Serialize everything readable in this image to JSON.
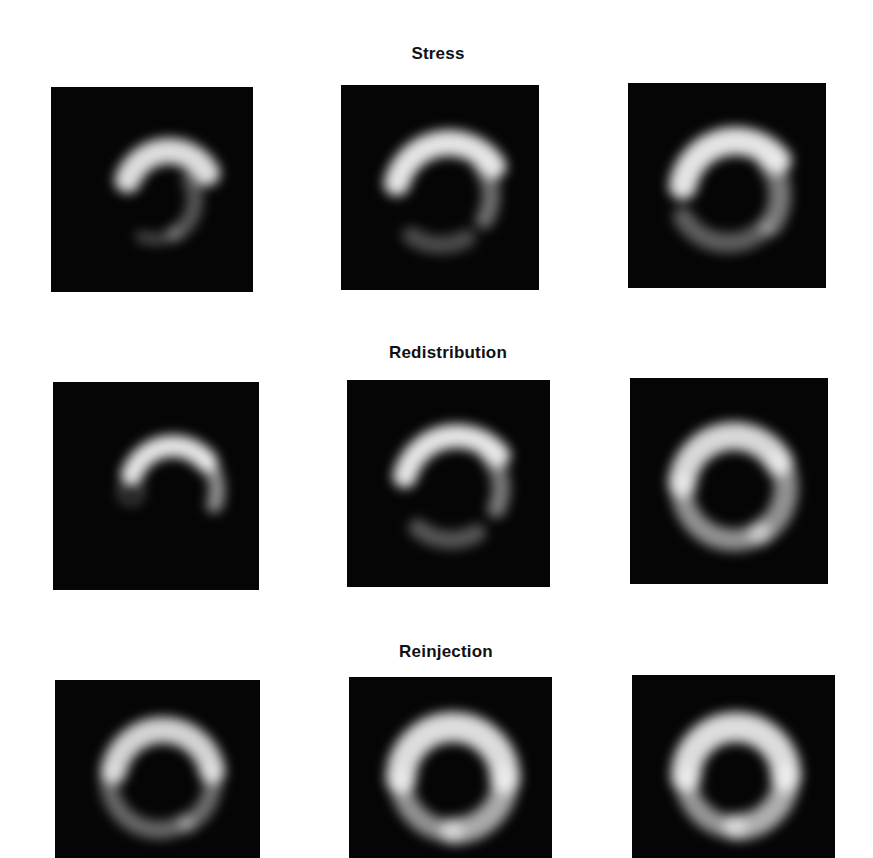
{
  "figure": {
    "rows": [
      {
        "title": "Stress",
        "title_pos": {
          "x": 438,
          "y": 44
        },
        "panels": [
          {
            "label": "stress-slice-1",
            "box": {
              "x": 51,
              "y": 87,
              "w": 202,
              "h": 205
            },
            "arcs": [
              {
                "cx": 118,
                "cy": 108,
                "r": 44,
                "start": -70,
                "end": 60,
                "width": 26,
                "opacity": 0.92
              },
              {
                "cx": 104,
                "cy": 112,
                "r": 40,
                "start": 60,
                "end": 150,
                "width": 16,
                "opacity": 0.35
              },
              {
                "cx": 104,
                "cy": 112,
                "r": 40,
                "start": 150,
                "end": 200,
                "width": 12,
                "opacity": 0.28
              }
            ]
          },
          {
            "label": "stress-slice-2",
            "box": {
              "x": 341,
              "y": 85,
              "w": 198,
              "h": 205
            },
            "arcs": [
              {
                "cx": 108,
                "cy": 112,
                "r": 54,
                "start": -75,
                "end": 55,
                "width": 26,
                "opacity": 0.95
              },
              {
                "cx": 100,
                "cy": 110,
                "r": 50,
                "start": 55,
                "end": 120,
                "width": 18,
                "opacity": 0.45
              },
              {
                "cx": 100,
                "cy": 108,
                "r": 52,
                "start": 150,
                "end": 215,
                "width": 18,
                "opacity": 0.3
              }
            ]
          },
          {
            "label": "stress-slice-3",
            "box": {
              "x": 628,
              "y": 83,
              "w": 198,
              "h": 205
            },
            "arcs": [
              {
                "cx": 108,
                "cy": 112,
                "r": 54,
                "start": -80,
                "end": 50,
                "width": 28,
                "opacity": 0.95
              },
              {
                "cx": 100,
                "cy": 112,
                "r": 52,
                "start": 50,
                "end": 125,
                "width": 22,
                "opacity": 0.5
              },
              {
                "cx": 100,
                "cy": 108,
                "r": 52,
                "start": 140,
                "end": 240,
                "width": 20,
                "opacity": 0.38
              }
            ]
          }
        ]
      },
      {
        "title": "Redistribution",
        "title_pos": {
          "x": 448,
          "y": 343
        },
        "panels": [
          {
            "label": "redistribution-slice-1",
            "box": {
              "x": 53,
              "y": 382,
              "w": 206,
              "h": 208
            },
            "arcs": [
              {
                "cx": 120,
                "cy": 108,
                "r": 44,
                "start": -70,
                "end": 50,
                "width": 22,
                "opacity": 0.95
              },
              {
                "cx": 120,
                "cy": 108,
                "r": 44,
                "start": 50,
                "end": 110,
                "width": 16,
                "opacity": 0.6
              },
              {
                "cx": 78,
                "cy": 110,
                "r": 10,
                "start": 0,
                "end": 359,
                "width": 8,
                "opacity": 0.25
              }
            ]
          },
          {
            "label": "redistribution-slice-2",
            "box": {
              "x": 347,
              "y": 380,
              "w": 203,
              "h": 207
            },
            "arcs": [
              {
                "cx": 110,
                "cy": 110,
                "r": 54,
                "start": -75,
                "end": 50,
                "width": 24,
                "opacity": 0.95
              },
              {
                "cx": 104,
                "cy": 108,
                "r": 50,
                "start": 50,
                "end": 115,
                "width": 18,
                "opacity": 0.5
              },
              {
                "cx": 104,
                "cy": 108,
                "r": 52,
                "start": 150,
                "end": 220,
                "width": 18,
                "opacity": 0.35
              }
            ]
          },
          {
            "label": "redistribution-slice-3",
            "box": {
              "x": 630,
              "y": 378,
              "w": 198,
              "h": 206
            },
            "arcs": [
              {
                "cx": 104,
                "cy": 110,
                "r": 52,
                "start": -85,
                "end": 60,
                "width": 28,
                "opacity": 0.9
              },
              {
                "cx": 104,
                "cy": 110,
                "r": 52,
                "start": 60,
                "end": 150,
                "width": 24,
                "opacity": 0.6
              },
              {
                "cx": 104,
                "cy": 110,
                "r": 52,
                "start": 150,
                "end": 275,
                "width": 22,
                "opacity": 0.6
              }
            ]
          }
        ]
      },
      {
        "title": "Reinjection",
        "title_pos": {
          "x": 446,
          "y": 642
        },
        "panels": [
          {
            "label": "reinjection-slice-1",
            "box": {
              "x": 55,
              "y": 680,
              "w": 205,
              "h": 178
            },
            "arcs": [
              {
                "cx": 108,
                "cy": 100,
                "r": 50,
                "start": -80,
                "end": 80,
                "width": 26,
                "opacity": 0.88
              },
              {
                "cx": 108,
                "cy": 100,
                "r": 50,
                "start": 80,
                "end": 150,
                "width": 18,
                "opacity": 0.45
              },
              {
                "cx": 104,
                "cy": 100,
                "r": 50,
                "start": 150,
                "end": 280,
                "width": 18,
                "opacity": 0.42
              }
            ]
          },
          {
            "label": "reinjection-slice-2",
            "box": {
              "x": 349,
              "y": 677,
              "w": 203,
              "h": 181
            },
            "arcs": [
              {
                "cx": 104,
                "cy": 102,
                "r": 52,
                "start": -90,
                "end": 90,
                "width": 30,
                "opacity": 0.92
              },
              {
                "cx": 104,
                "cy": 102,
                "r": 52,
                "start": 90,
                "end": 180,
                "width": 26,
                "opacity": 0.7
              },
              {
                "cx": 104,
                "cy": 102,
                "r": 52,
                "start": 180,
                "end": 270,
                "width": 22,
                "opacity": 0.6
              }
            ]
          },
          {
            "label": "reinjection-slice-3",
            "box": {
              "x": 632,
              "y": 675,
              "w": 203,
              "h": 183
            },
            "arcs": [
              {
                "cx": 104,
                "cy": 102,
                "r": 50,
                "start": -90,
                "end": 90,
                "width": 30,
                "opacity": 0.92
              },
              {
                "cx": 104,
                "cy": 102,
                "r": 50,
                "start": 90,
                "end": 180,
                "width": 26,
                "opacity": 0.72
              },
              {
                "cx": 104,
                "cy": 102,
                "r": 50,
                "start": 180,
                "end": 270,
                "width": 22,
                "opacity": 0.62
              }
            ]
          }
        ]
      }
    ],
    "colors": {
      "background": "#ffffff",
      "panel_bg": "#050505",
      "tracer": "#f0f0f0",
      "title_text": "#111111"
    }
  }
}
